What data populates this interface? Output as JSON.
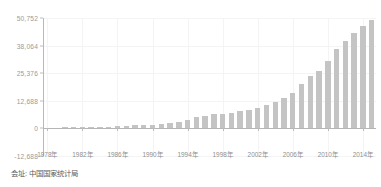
{
  "chart_data": {
    "type": "bar",
    "title": "",
    "subtitle": "",
    "xlabel": "",
    "ylabel": "",
    "grid": true,
    "legend": "none",
    "ylim": [
      -12688,
      50752
    ],
    "ytick_labels": [
      "50,752",
      "38,064",
      "25,376",
      "12,688",
      "0",
      "-12,688"
    ],
    "ytick_values": [
      50752,
      38064,
      25376,
      12688,
      0,
      -12688
    ],
    "xtick_labels": [
      "1978年",
      "1982年",
      "1986年",
      "1990年",
      "1994年",
      "1998年",
      "2002年",
      "2006年",
      "2010年",
      "2014年"
    ],
    "xtick_values": [
      1978,
      1982,
      1986,
      1990,
      1994,
      1998,
      2002,
      2006,
      2010,
      2014
    ],
    "categories": [
      "1978",
      "1979",
      "1980",
      "1981",
      "1982",
      "1983",
      "1984",
      "1985",
      "1986",
      "1987",
      "1988",
      "1989",
      "1990",
      "1991",
      "1992",
      "1993",
      "1994",
      "1995",
      "1996",
      "1997",
      "1998",
      "1999",
      "2000",
      "2001",
      "2002",
      "2003",
      "2004",
      "2005",
      "2006",
      "2007",
      "2008",
      "2009",
      "2010",
      "2011",
      "2012",
      "2013",
      "2014",
      "2015"
    ],
    "values": [
      385,
      423,
      468,
      497,
      533,
      593,
      695,
      858,
      963,
      1112,
      1366,
      1519,
      1644,
      1893,
      2311,
      2998,
      4044,
      5046,
      5846,
      6420,
      6796,
      7159,
      7858,
      8622,
      9398,
      10542,
      12336,
      14185,
      16500,
      20505,
      24121,
      26222,
      30876,
      36403,
      40007,
      43852,
      47203,
      49992
    ]
  },
  "caption": {
    "text": "会址: 中国国家统计局"
  },
  "colors": {
    "bar": "#c4c4c4",
    "axis": "#b9b9b9",
    "grid": "#f4f4f4",
    "tick_text": "#9a9a9a",
    "caption_text": "#5d5d5d",
    "background": "#ffffff"
  }
}
